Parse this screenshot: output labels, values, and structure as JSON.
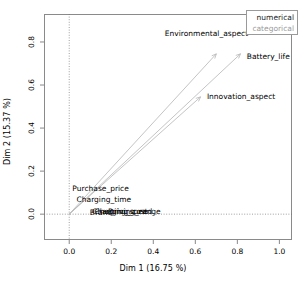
{
  "chart_data": {
    "type": "scatter",
    "title": "",
    "xlabel": "Dim 1 (16.75 %)",
    "ylabel": "Dim 2 (15.37 %)",
    "xlim": [
      -0.12,
      1.06
    ],
    "ylim": [
      -0.12,
      0.93
    ],
    "xticks": [
      "0.0",
      "0.2",
      "0.4",
      "0.6",
      "0.8",
      "1.0"
    ],
    "xtick_values": [
      0.0,
      0.2,
      0.4,
      0.6,
      0.8,
      1.0
    ],
    "yticks": [
      "0.0",
      "0.2",
      "0.4",
      "0.6",
      "0.8"
    ],
    "ytick_values": [
      0.0,
      0.2,
      0.4,
      0.6,
      0.8
    ],
    "grid": false,
    "reference_lines": {
      "x": 0.0,
      "y": 0.0,
      "style": "dotted"
    },
    "legend": {
      "position": "top-right",
      "entries": [
        {
          "label": "numerical",
          "color": "#1a1a1a"
        },
        {
          "label": "categorical",
          "color": "#9a9a9a"
        }
      ]
    },
    "arrow_color": "#b5b5b5",
    "points": [
      {
        "label": "Environmental_aspect",
        "x": 0.7,
        "y": 0.745,
        "group": "numerical",
        "label_x": 0.455,
        "label_y": 0.835
      },
      {
        "label": "Battery_life",
        "x": 0.815,
        "y": 0.745,
        "group": "numerical",
        "label_x": 0.845,
        "label_y": 0.728
      },
      {
        "label": "Innovation_aspect",
        "x": 0.625,
        "y": 0.545,
        "group": "numerical",
        "label_x": 0.655,
        "label_y": 0.545
      },
      {
        "label": "Purchase_price",
        "x": 0.105,
        "y": 0.108,
        "group": "categorical",
        "label_x": 0.015,
        "label_y": 0.118
      },
      {
        "label": "Charging_time",
        "x": 0.105,
        "y": 0.055,
        "group": "categorical",
        "label_x": 0.035,
        "label_y": 0.068
      },
      {
        "label": "Driving_range",
        "x": 0.17,
        "y": 0.005,
        "group": "categorical",
        "label_x": 0.185,
        "label_y": 0.012
      },
      {
        "label": "Charging_cost",
        "x": 0.15,
        "y": 0.004,
        "group": "categorical",
        "label_x": 0.12,
        "label_y": 0.01
      },
      {
        "label": "Charging_speed",
        "x": 0.145,
        "y": 0.003,
        "group": "categorical",
        "label_x": 0.108,
        "label_y": 0.008
      },
      {
        "label": "Brand",
        "x": 0.135,
        "y": 0.002,
        "group": "categorical",
        "label_x": 0.098,
        "label_y": 0.006
      }
    ]
  }
}
